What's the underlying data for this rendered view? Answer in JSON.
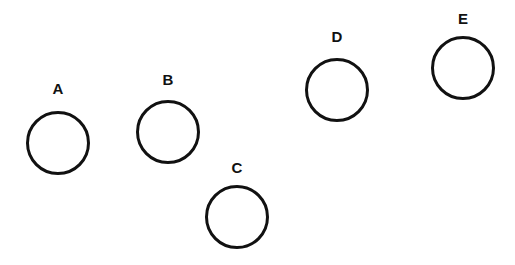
{
  "diagram": {
    "background": "#ffffff",
    "stroke_color": "#111111",
    "circles": [
      {
        "label": "A",
        "cx": 58,
        "cy": 143,
        "r": 32,
        "label_y": 81
      },
      {
        "label": "B",
        "cx": 168,
        "cy": 132,
        "r": 32,
        "label_y": 72
      },
      {
        "label": "C",
        "cx": 237,
        "cy": 217,
        "r": 32,
        "label_y": 160
      },
      {
        "label": "D",
        "cx": 337,
        "cy": 90,
        "r": 32,
        "label_y": 29
      },
      {
        "label": "E",
        "cx": 463,
        "cy": 68,
        "r": 32,
        "label_y": 11
      }
    ]
  }
}
